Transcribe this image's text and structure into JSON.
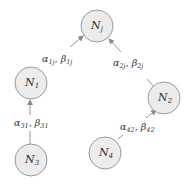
{
  "colors": {
    "node_fill": "#ececec",
    "node_stroke": "#9a9a9a",
    "edge": "#8a8a8a",
    "text": "#333333",
    "background": "#ffffff"
  },
  "nodes": [
    {
      "id": "Nj",
      "base": "N",
      "sub": "j",
      "cx": 97,
      "cy": 26,
      "r": 16
    },
    {
      "id": "N1",
      "base": "N",
      "sub": "1",
      "cx": 31,
      "cy": 83,
      "r": 16
    },
    {
      "id": "N2",
      "base": "N",
      "sub": "2",
      "cx": 164,
      "cy": 98,
      "r": 16
    },
    {
      "id": "N3",
      "base": "N",
      "sub": "3",
      "cx": 31,
      "cy": 160,
      "r": 16
    },
    {
      "id": "N4",
      "base": "N",
      "sub": "4",
      "cx": 105,
      "cy": 153,
      "r": 16
    }
  ],
  "edges": [
    {
      "from": "N1",
      "to": "Nj",
      "label": {
        "alpha": "α",
        "alpha_sub": "1j",
        "sep": ", ",
        "beta": "β",
        "beta_sub": "1j"
      }
    },
    {
      "from": "N2",
      "to": "Nj",
      "label": {
        "alpha": "α",
        "alpha_sub": "2j",
        "sep": ", ",
        "beta": "β",
        "beta_sub": "2j"
      }
    },
    {
      "from": "N3",
      "to": "N1",
      "label": {
        "alpha": "α",
        "alpha_sub": "31",
        "sep": ", ",
        "beta": "β",
        "beta_sub": "31"
      }
    },
    {
      "from": "N4",
      "to": "N2",
      "label": {
        "alpha": "α",
        "alpha_sub": "42",
        "sep": ", ",
        "beta": "β",
        "beta_sub": "42"
      }
    }
  ]
}
